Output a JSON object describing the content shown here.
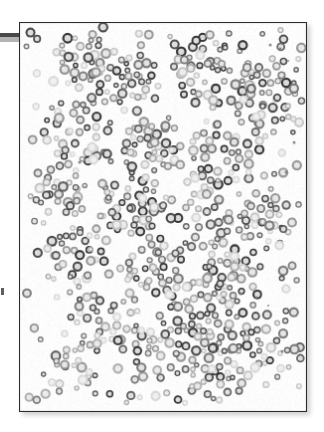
{
  "figure": {
    "kind": "micrograph-panel",
    "background_color": "#ffffff",
    "panel": {
      "x": 19,
      "y": 22,
      "width": 288,
      "height": 390,
      "fill_color": "#fdfdfd",
      "border_color": "#2b2b2b",
      "border_width": 1.5,
      "shadow_color": "rgba(0,0,0,0.20)",
      "shadow_offset_x": 3,
      "shadow_offset_y": 3,
      "shadow_blur": 5
    },
    "margin_marks": [
      {
        "name": "rule-dark",
        "x": 0,
        "y": 33,
        "width": 22,
        "height": 4,
        "color": "#4a4a4a"
      },
      {
        "name": "rule-light",
        "x": 0,
        "y": 37,
        "width": 22,
        "height": 5,
        "color": "#b4b4b4"
      },
      {
        "name": "tick-mark",
        "x": 1,
        "y": 288,
        "width": 3,
        "height": 7,
        "color": "#5d5d5d"
      }
    ]
  },
  "chart_data": {
    "type": "scatter",
    "title": "",
    "subtitle": "",
    "xlabel": "",
    "ylabel": "",
    "grid": false,
    "legend": null,
    "annotations": [],
    "xlim": [
      0,
      288
    ],
    "ylim": [
      0,
      390
    ],
    "axis_visible": false,
    "marker": {
      "shape": "ring",
      "mean_diameter_px": 8.2,
      "diameter_range_px": [
        5.5,
        11.0
      ],
      "ring_thickness_px": 2.0,
      "center_fill": "#f2f2f2"
    },
    "palette": {
      "very_dark": "#2e2e2e",
      "dark": "#474747",
      "mid_dark": "#5e5e5e",
      "mid": "#787878",
      "mid_light": "#949494",
      "light": "#adadad",
      "very_light": "#c6c6c6",
      "faint": "#d8d8d8"
    },
    "tone_distribution": {
      "very_dark": 0.1,
      "dark": 0.16,
      "mid_dark": 0.15,
      "mid": 0.15,
      "mid_light": 0.14,
      "light": 0.13,
      "very_light": 0.1,
      "faint": 0.07
    },
    "total_markers": 690,
    "density_clusters": [
      {
        "cx": 62,
        "cy": 34,
        "radius": 30,
        "weight": 0.55,
        "tone_bias": -0.1
      },
      {
        "cx": 108,
        "cy": 58,
        "radius": 34,
        "weight": 0.9,
        "tone_bias": 0.35
      },
      {
        "cx": 196,
        "cy": 48,
        "radius": 40,
        "weight": 0.85,
        "tone_bias": 0.3
      },
      {
        "cx": 245,
        "cy": 74,
        "radius": 34,
        "weight": 0.8,
        "tone_bias": 0.25
      },
      {
        "cx": 58,
        "cy": 108,
        "radius": 36,
        "weight": 0.75,
        "tone_bias": 0.15
      },
      {
        "cx": 132,
        "cy": 120,
        "radius": 32,
        "weight": 0.6,
        "tone_bias": 0.1
      },
      {
        "cx": 205,
        "cy": 132,
        "radius": 36,
        "weight": 0.8,
        "tone_bias": 0.3
      },
      {
        "cx": 40,
        "cy": 170,
        "radius": 30,
        "weight": 0.55,
        "tone_bias": -0.15
      },
      {
        "cx": 112,
        "cy": 182,
        "radius": 32,
        "weight": 0.75,
        "tone_bias": 0.25
      },
      {
        "cx": 190,
        "cy": 200,
        "radius": 34,
        "weight": 0.65,
        "tone_bias": 0.0
      },
      {
        "cx": 248,
        "cy": 196,
        "radius": 30,
        "weight": 0.6,
        "tone_bias": 0.1
      },
      {
        "cx": 58,
        "cy": 232,
        "radius": 32,
        "weight": 0.6,
        "tone_bias": 0.0
      },
      {
        "cx": 136,
        "cy": 244,
        "radius": 30,
        "weight": 0.7,
        "tone_bias": 0.2
      },
      {
        "cx": 212,
        "cy": 250,
        "radius": 34,
        "weight": 0.7,
        "tone_bias": 0.15
      },
      {
        "cx": 176,
        "cy": 296,
        "radius": 38,
        "weight": 0.95,
        "tone_bias": 0.45
      },
      {
        "cx": 240,
        "cy": 312,
        "radius": 32,
        "weight": 0.7,
        "tone_bias": 0.2
      },
      {
        "cx": 72,
        "cy": 300,
        "radius": 30,
        "weight": 0.5,
        "tone_bias": -0.05
      },
      {
        "cx": 120,
        "cy": 330,
        "radius": 28,
        "weight": 0.45,
        "tone_bias": -0.1
      },
      {
        "cx": 196,
        "cy": 352,
        "radius": 32,
        "weight": 0.65,
        "tone_bias": 0.15
      },
      {
        "cx": 50,
        "cy": 350,
        "radius": 26,
        "weight": 0.4,
        "tone_bias": -0.1
      }
    ],
    "sparse_specks": [
      {
        "x": 252,
        "y": 22,
        "size": 3
      },
      {
        "x": 262,
        "y": 26,
        "size": 3
      },
      {
        "x": 270,
        "y": 38,
        "size": 2
      },
      {
        "x": 276,
        "y": 120,
        "size": 3
      },
      {
        "x": 268,
        "y": 150,
        "size": 3
      },
      {
        "x": 222,
        "y": 272,
        "size": 3
      },
      {
        "x": 238,
        "y": 276,
        "size": 3
      },
      {
        "x": 250,
        "y": 284,
        "size": 2
      },
      {
        "x": 264,
        "y": 330,
        "size": 3
      },
      {
        "x": 60,
        "y": 140,
        "size": 3
      },
      {
        "x": 150,
        "y": 98,
        "size": 2
      },
      {
        "x": 196,
        "y": 330,
        "size": 2
      }
    ]
  }
}
